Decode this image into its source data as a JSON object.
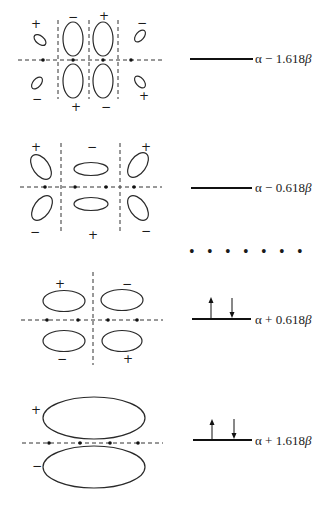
{
  "orbitals": [
    {
      "id": "psi4",
      "energy_label": "α − 1.618 β",
      "energy_alpha": "α",
      "energy_op": "−",
      "energy_coef": "1.618",
      "energy_beta": "β",
      "electrons": 0,
      "nodes": 3,
      "signs": [
        "+",
        "−",
        "+",
        "−",
        "−",
        "+",
        "−",
        "+"
      ]
    },
    {
      "id": "psi3",
      "energy_label": "α − 0.618 β",
      "energy_alpha": "α",
      "energy_op": "−",
      "energy_coef": "0.618",
      "energy_beta": "β",
      "electrons": 0,
      "nodes": 2,
      "signs": [
        "+",
        "−",
        "+",
        "−",
        "+",
        "−"
      ]
    },
    {
      "id": "psi2",
      "energy_label": "α + 0.618 β",
      "energy_alpha": "α",
      "energy_op": "+",
      "energy_coef": "0.618",
      "energy_beta": "β",
      "electrons": 2,
      "nodes": 1,
      "signs": [
        "+",
        "−",
        "−",
        "+"
      ]
    },
    {
      "id": "psi1",
      "energy_label": "α + 1.618 β",
      "energy_alpha": "α",
      "energy_op": "+",
      "energy_coef": "1.618",
      "energy_beta": "β",
      "electrons": 2,
      "nodes": 0,
      "signs": [
        "+",
        "−"
      ]
    }
  ],
  "separator": "• • • • • • •",
  "colors": {
    "ink": "#1a1a1a",
    "background": "#ffffff"
  }
}
